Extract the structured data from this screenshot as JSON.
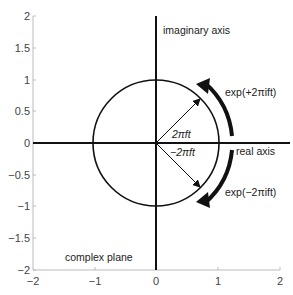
{
  "figure": {
    "type": "diagram",
    "title": "complex plane",
    "x_axis_label": "real axis",
    "y_axis_label": "imaginary axis",
    "xlim": [
      -2,
      2
    ],
    "ylim": [
      -2,
      2
    ],
    "x_ticks": [
      "−2",
      "−1",
      "0",
      "1",
      "2"
    ],
    "y_ticks": [
      "2",
      "1.5",
      "1",
      "0.5",
      "0",
      "−0.5",
      "−1",
      "−1.5",
      "−2"
    ],
    "unit_circle_radius": 1,
    "vector_up_label": "2πft",
    "vector_down_label": "−2πft",
    "arrow_up_label": "exp(+2πift)",
    "arrow_down_label": "exp(−2πift)",
    "colors": {
      "stroke": "#111111",
      "frame": "#bbbbbb",
      "text": "#222222"
    }
  }
}
